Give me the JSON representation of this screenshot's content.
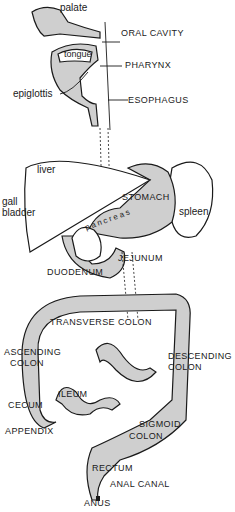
{
  "diagram": {
    "colors": {
      "ink": "#1a1a1a",
      "stipple": "#cfcfcf",
      "background": "#ffffff"
    },
    "labels": {
      "palate": "palate",
      "oral_cavity": "ORAL CAVITY",
      "tongue": "tongue",
      "pharynx": "PHARYNX",
      "epiglottis": "epiglottis",
      "esophagus": "ESOPHAGUS",
      "liver": "liver",
      "gall": "gall",
      "bladder": "bladder",
      "stomach": "STOMACH",
      "spleen": "spleen",
      "pancreas": "pancreas",
      "jejunum": "JEJUNUM",
      "duodenum": "DUODENUM",
      "transverse_colon": "TRANSVERSE COLON",
      "ascending": "ASCENDING",
      "ascending_colon": "COLON",
      "descending": "DESCENDING",
      "descending_colon": "COLON",
      "cecum": "CECUM",
      "ileum": "ILEUM",
      "appendix": "APPENDIX",
      "sigmoid": "SIGMOID",
      "sigmoid_colon": "COLON",
      "rectum": "RECTUM",
      "anal_canal": "ANAL CANAL",
      "anus": "ANUS"
    }
  }
}
